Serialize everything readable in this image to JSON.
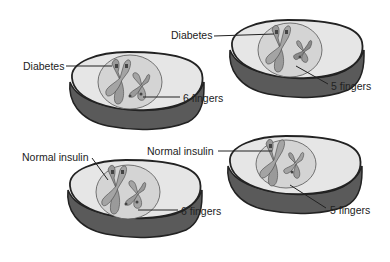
{
  "diagram": {
    "type": "homologous-chromosome-cells",
    "cells": [
      {
        "id": "top-left",
        "labels": [
          {
            "text": "Diabetes",
            "side": "left"
          },
          {
            "text": "6 fingers",
            "side": "right"
          }
        ]
      },
      {
        "id": "top-right",
        "labels": [
          {
            "text": "Diabetes",
            "side": "left"
          },
          {
            "text": "5 fingers",
            "side": "right"
          }
        ]
      },
      {
        "id": "bottom-left",
        "labels": [
          {
            "text": "Normal insulin",
            "side": "left"
          },
          {
            "text": "6 fingers",
            "side": "right"
          }
        ]
      },
      {
        "id": "bottom-right",
        "labels": [
          {
            "text": "Normal insulin",
            "side": "left"
          },
          {
            "text": "5 fingers",
            "side": "right"
          }
        ]
      }
    ],
    "colors": {
      "cell_top": "#e6e6e6",
      "cell_side": "#5a5a5a",
      "outline": "#222222",
      "nucleus": "#d0d0d0",
      "chromosome": "#9a9a9a",
      "band": "#555555"
    }
  }
}
